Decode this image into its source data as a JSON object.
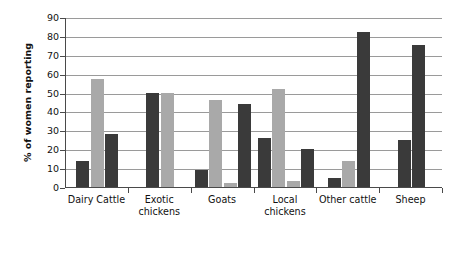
{
  "chart_data": {
    "type": "bar",
    "title": "",
    "subtitle": "",
    "xlabel": "",
    "ylabel": "% of women reporting",
    "ylim": [
      0,
      90
    ],
    "ytick_step": 10,
    "yticks": [
      0,
      10,
      20,
      30,
      40,
      50,
      60,
      70,
      80,
      90
    ],
    "grid": true,
    "legend": "none",
    "grouped": true,
    "categories": [
      "Dairy Cattle",
      "Exotic chickens",
      "Goats",
      "Local chickens",
      "Other cattle",
      "Sheep"
    ],
    "groups": [
      {
        "category": "Dairy Cattle",
        "label_lines": [
          "Dairy Cattle"
        ],
        "bars": [
          {
            "value": 14,
            "color_key": "dark"
          },
          {
            "value": 57,
            "color_key": "light"
          },
          {
            "value": 28,
            "color_key": "dark"
          }
        ]
      },
      {
        "category": "Exotic chickens",
        "label_lines": [
          "Exotic",
          "chickens"
        ],
        "bars": [
          {
            "value": 50,
            "color_key": "dark"
          },
          {
            "value": 50,
            "color_key": "light"
          }
        ]
      },
      {
        "category": "Goats",
        "label_lines": [
          "Goats"
        ],
        "bars": [
          {
            "value": 9,
            "color_key": "dark"
          },
          {
            "value": 46,
            "color_key": "light"
          },
          {
            "value": 2,
            "color_key": "light"
          },
          {
            "value": 44,
            "color_key": "dark"
          }
        ]
      },
      {
        "category": "Local chickens",
        "label_lines": [
          "Local",
          "chickens"
        ],
        "bars": [
          {
            "value": 26,
            "color_key": "dark"
          },
          {
            "value": 52,
            "color_key": "light"
          },
          {
            "value": 3,
            "color_key": "light"
          },
          {
            "value": 20,
            "color_key": "dark"
          }
        ]
      },
      {
        "category": "Other cattle",
        "label_lines": [
          "Other cattle"
        ],
        "bars": [
          {
            "value": 5,
            "color_key": "dark"
          },
          {
            "value": 14,
            "color_key": "light"
          },
          {
            "value": 82,
            "color_key": "dark"
          }
        ]
      },
      {
        "category": "Sheep",
        "label_lines": [
          "Sheep"
        ],
        "bars": [
          {
            "value": 25,
            "color_key": "dark"
          },
          {
            "value": 75,
            "color_key": "dark"
          }
        ]
      }
    ],
    "colors": {
      "dark": "#3a3a3a",
      "light": "#a9a9a9",
      "axis": "#4a4a4a",
      "grid": "#9a9a9a",
      "background": "#ffffff",
      "text": "#111111"
    }
  }
}
